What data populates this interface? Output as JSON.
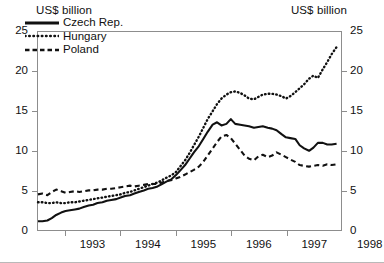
{
  "chart_data": {
    "type": "line",
    "title": "",
    "xlabel": "",
    "ylabel": "US$ billion",
    "ylabel_right": "US$ billion",
    "ylim": [
      0,
      25
    ],
    "yticks": [
      0,
      5,
      10,
      15,
      20,
      25
    ],
    "yticks_right": [
      0,
      5,
      10,
      15,
      20,
      25
    ],
    "xlim": [
      1992.5,
      1998.0
    ],
    "xticks": [
      1993,
      1994,
      1995,
      1996,
      1997,
      1998
    ],
    "xtick_labels": [
      "1993",
      "1994",
      "1995",
      "1996",
      "1997",
      "1998"
    ],
    "grid": false,
    "legend_position": "top-left",
    "units": "US$ billion",
    "series": [
      {
        "name": "Czech Rep.",
        "style": "solid",
        "color": "#111111",
        "points": [
          [
            1992.5,
            1.1
          ],
          [
            1992.58,
            1.1
          ],
          [
            1992.67,
            1.2
          ],
          [
            1992.75,
            1.5
          ],
          [
            1992.83,
            1.9
          ],
          [
            1992.92,
            2.2
          ],
          [
            1993.0,
            2.4
          ],
          [
            1993.08,
            2.5
          ],
          [
            1993.17,
            2.6
          ],
          [
            1993.25,
            2.7
          ],
          [
            1993.33,
            2.9
          ],
          [
            1993.42,
            3.1
          ],
          [
            1993.5,
            3.2
          ],
          [
            1993.58,
            3.4
          ],
          [
            1993.67,
            3.5
          ],
          [
            1993.75,
            3.7
          ],
          [
            1993.83,
            3.8
          ],
          [
            1993.92,
            3.9
          ],
          [
            1994.0,
            4.1
          ],
          [
            1994.08,
            4.3
          ],
          [
            1994.17,
            4.4
          ],
          [
            1994.25,
            4.6
          ],
          [
            1994.33,
            4.8
          ],
          [
            1994.42,
            5.0
          ],
          [
            1994.5,
            5.2
          ],
          [
            1994.58,
            5.3
          ],
          [
            1994.67,
            5.5
          ],
          [
            1994.75,
            5.8
          ],
          [
            1994.83,
            6.1
          ],
          [
            1994.92,
            6.4
          ],
          [
            1995.0,
            6.9
          ],
          [
            1995.08,
            7.5
          ],
          [
            1995.17,
            8.2
          ],
          [
            1995.25,
            9.0
          ],
          [
            1995.33,
            9.8
          ],
          [
            1995.42,
            10.6
          ],
          [
            1995.5,
            11.5
          ],
          [
            1995.58,
            12.4
          ],
          [
            1995.67,
            13.3
          ],
          [
            1995.75,
            13.6
          ],
          [
            1995.83,
            13.2
          ],
          [
            1995.92,
            13.4
          ],
          [
            1996.0,
            14.0
          ],
          [
            1996.08,
            13.4
          ],
          [
            1996.17,
            13.3
          ],
          [
            1996.25,
            13.2
          ],
          [
            1996.33,
            13.1
          ],
          [
            1996.42,
            12.9
          ],
          [
            1996.5,
            13.0
          ],
          [
            1996.58,
            13.1
          ],
          [
            1996.67,
            12.9
          ],
          [
            1996.75,
            12.8
          ],
          [
            1996.83,
            12.6
          ],
          [
            1996.92,
            12.1
          ],
          [
            1997.0,
            11.7
          ],
          [
            1997.08,
            11.6
          ],
          [
            1997.17,
            11.5
          ],
          [
            1997.25,
            10.7
          ],
          [
            1997.33,
            10.3
          ],
          [
            1997.42,
            10.0
          ],
          [
            1997.5,
            10.4
          ],
          [
            1997.58,
            11.0
          ],
          [
            1997.67,
            11.0
          ],
          [
            1997.75,
            10.8
          ],
          [
            1997.83,
            10.8
          ],
          [
            1997.92,
            10.9
          ]
        ]
      },
      {
        "name": "Hungary",
        "style": "dotted",
        "color": "#111111",
        "points": [
          [
            1992.5,
            3.5
          ],
          [
            1992.58,
            3.5
          ],
          [
            1992.67,
            3.4
          ],
          [
            1992.75,
            3.4
          ],
          [
            1992.83,
            3.5
          ],
          [
            1992.92,
            3.4
          ],
          [
            1993.0,
            3.4
          ],
          [
            1993.08,
            3.5
          ],
          [
            1993.17,
            3.5
          ],
          [
            1993.25,
            3.6
          ],
          [
            1993.33,
            3.7
          ],
          [
            1993.42,
            3.8
          ],
          [
            1993.5,
            3.9
          ],
          [
            1993.58,
            4.0
          ],
          [
            1993.67,
            4.1
          ],
          [
            1993.75,
            4.2
          ],
          [
            1993.83,
            4.3
          ],
          [
            1993.92,
            4.4
          ],
          [
            1994.0,
            4.5
          ],
          [
            1994.08,
            4.7
          ],
          [
            1994.17,
            4.8
          ],
          [
            1994.25,
            5.0
          ],
          [
            1994.33,
            5.2
          ],
          [
            1994.42,
            5.4
          ],
          [
            1994.5,
            5.6
          ],
          [
            1994.58,
            5.8
          ],
          [
            1994.67,
            6.0
          ],
          [
            1994.75,
            6.3
          ],
          [
            1994.83,
            6.6
          ],
          [
            1994.92,
            6.9
          ],
          [
            1995.0,
            7.3
          ],
          [
            1995.08,
            8.0
          ],
          [
            1995.17,
            8.8
          ],
          [
            1995.25,
            9.7
          ],
          [
            1995.33,
            10.7
          ],
          [
            1995.42,
            11.8
          ],
          [
            1995.5,
            12.9
          ],
          [
            1995.58,
            14.0
          ],
          [
            1995.67,
            15.0
          ],
          [
            1995.75,
            15.9
          ],
          [
            1995.83,
            16.6
          ],
          [
            1995.92,
            17.1
          ],
          [
            1996.0,
            17.4
          ],
          [
            1996.08,
            17.5
          ],
          [
            1996.17,
            17.3
          ],
          [
            1996.25,
            17.0
          ],
          [
            1996.33,
            16.6
          ],
          [
            1996.42,
            16.5
          ],
          [
            1996.5,
            16.8
          ],
          [
            1996.58,
            17.1
          ],
          [
            1996.67,
            17.2
          ],
          [
            1996.75,
            17.2
          ],
          [
            1996.83,
            17.1
          ],
          [
            1996.92,
            16.9
          ],
          [
            1997.0,
            16.6
          ],
          [
            1997.08,
            16.9
          ],
          [
            1997.17,
            17.4
          ],
          [
            1997.25,
            17.9
          ],
          [
            1997.33,
            18.4
          ],
          [
            1997.42,
            19.1
          ],
          [
            1997.5,
            19.5
          ],
          [
            1997.58,
            19.2
          ],
          [
            1997.67,
            20.3
          ],
          [
            1997.75,
            21.2
          ],
          [
            1997.83,
            22.2
          ],
          [
            1997.92,
            23.1
          ]
        ]
      },
      {
        "name": "Poland",
        "style": "dashed",
        "color": "#111111",
        "points": [
          [
            1992.5,
            4.5
          ],
          [
            1992.58,
            4.6
          ],
          [
            1992.67,
            4.4
          ],
          [
            1992.75,
            4.8
          ],
          [
            1992.83,
            5.1
          ],
          [
            1992.92,
            4.9
          ],
          [
            1993.0,
            4.7
          ],
          [
            1993.08,
            4.8
          ],
          [
            1993.17,
            4.9
          ],
          [
            1993.25,
            4.8
          ],
          [
            1993.33,
            4.9
          ],
          [
            1993.42,
            5.0
          ],
          [
            1993.5,
            5.0
          ],
          [
            1993.58,
            5.1
          ],
          [
            1993.67,
            5.1
          ],
          [
            1993.75,
            5.2
          ],
          [
            1993.83,
            5.2
          ],
          [
            1993.92,
            5.3
          ],
          [
            1994.0,
            5.4
          ],
          [
            1994.08,
            5.5
          ],
          [
            1994.17,
            5.6
          ],
          [
            1994.25,
            5.5
          ],
          [
            1994.33,
            5.6
          ],
          [
            1994.42,
            5.7
          ],
          [
            1994.5,
            5.8
          ],
          [
            1994.58,
            5.8
          ],
          [
            1994.67,
            5.8
          ],
          [
            1994.75,
            6.0
          ],
          [
            1994.83,
            6.2
          ],
          [
            1994.92,
            6.3
          ],
          [
            1995.0,
            6.5
          ],
          [
            1995.08,
            6.7
          ],
          [
            1995.17,
            7.0
          ],
          [
            1995.25,
            7.3
          ],
          [
            1995.33,
            7.6
          ],
          [
            1995.42,
            8.0
          ],
          [
            1995.5,
            8.6
          ],
          [
            1995.58,
            9.4
          ],
          [
            1995.67,
            10.3
          ],
          [
            1995.75,
            11.1
          ],
          [
            1995.83,
            11.8
          ],
          [
            1995.92,
            12.0
          ],
          [
            1996.0,
            11.6
          ],
          [
            1996.08,
            10.9
          ],
          [
            1996.17,
            10.1
          ],
          [
            1996.25,
            9.4
          ],
          [
            1996.33,
            9.0
          ],
          [
            1996.42,
            8.8
          ],
          [
            1996.5,
            9.3
          ],
          [
            1996.58,
            9.5
          ],
          [
            1996.67,
            9.2
          ],
          [
            1996.75,
            9.4
          ],
          [
            1996.83,
            9.8
          ],
          [
            1996.92,
            9.5
          ],
          [
            1997.0,
            9.2
          ],
          [
            1997.08,
            8.9
          ],
          [
            1997.17,
            8.6
          ],
          [
            1997.25,
            8.2
          ],
          [
            1997.33,
            8.1
          ],
          [
            1997.42,
            8.0
          ],
          [
            1997.5,
            8.1
          ],
          [
            1997.58,
            8.2
          ],
          [
            1997.67,
            8.1
          ],
          [
            1997.75,
            8.3
          ],
          [
            1997.83,
            8.2
          ],
          [
            1997.92,
            8.3
          ]
        ]
      }
    ],
    "legend": [
      "Czech Rep.",
      "Hungary",
      "Poland"
    ]
  },
  "axes": {
    "unit_left": "US$ billion",
    "unit_right": "US$ billion"
  }
}
